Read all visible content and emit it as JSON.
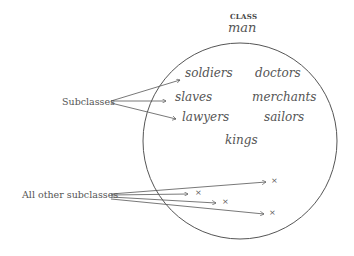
{
  "header": {
    "class_label": "CLASS",
    "class_name": "man"
  },
  "members": [
    {
      "label": "soldiers",
      "x": 196,
      "y": 68
    },
    {
      "label": "doctors",
      "x": 255,
      "y": 68
    },
    {
      "label": "slaves",
      "x": 176,
      "y": 91
    },
    {
      "label": "merchants",
      "x": 252,
      "y": 91
    },
    {
      "label": "lawyers",
      "x": 182,
      "y": 111
    },
    {
      "label": "sailors",
      "x": 264,
      "y": 111
    },
    {
      "label": "kings",
      "x": 225,
      "y": 134
    }
  ],
  "left_labels": {
    "subclasses": "Subclasses",
    "all_other": "All other subclasses"
  },
  "markers": [
    "×",
    "×",
    "×",
    "×"
  ],
  "colors": {
    "stroke": "#555555",
    "text": "#555555"
  }
}
